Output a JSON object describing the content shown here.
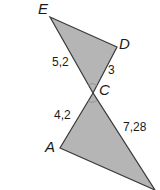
{
  "figure": {
    "type": "two triangles sharing vertex C (vertical angles)",
    "fill_color": "#b5b5b5",
    "stroke_color": "#3a3a3a",
    "vertices": {
      "E": {
        "label": "E",
        "x": 50,
        "y": 17
      },
      "D": {
        "label": "D",
        "x": 117,
        "y": 47
      },
      "C": {
        "label": "C",
        "x": 93,
        "y": 93
      },
      "A": {
        "label": "A",
        "x": 60,
        "y": 148
      },
      "B": {
        "label": "",
        "x": 155,
        "y": 190
      }
    },
    "side_labels": {
      "EC": "5,2",
      "DC": "3",
      "AC": "4,2",
      "CB": "7,28"
    },
    "triangles": [
      {
        "name": "upper-triangle",
        "points": [
          "E",
          "D",
          "C"
        ]
      },
      {
        "name": "lower-triangle",
        "points": [
          "C",
          "A",
          "B"
        ]
      }
    ]
  }
}
